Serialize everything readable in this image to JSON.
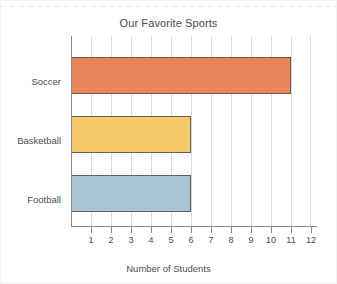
{
  "chart_data": {
    "type": "bar",
    "orientation": "horizontal",
    "title": "Our Favorite Sports",
    "xlabel": "Number of Students",
    "ylabel": "",
    "categories": [
      "Soccer",
      "Basketball",
      "Football"
    ],
    "values": [
      11,
      6,
      6
    ],
    "bars": [
      {
        "category": "Soccer",
        "value": 11,
        "color": "#E8855C",
        "border_color": "#6B5A4E"
      },
      {
        "category": "Basketball",
        "value": 6,
        "color": "#F4C969",
        "border_color": "#6B5A4E"
      },
      {
        "category": "Football",
        "value": 6,
        "color": "#A9C2D4",
        "border_color": "#6B5A4E"
      }
    ],
    "xlim": [
      0,
      12
    ],
    "xticks": [
      1,
      2,
      3,
      4,
      5,
      6,
      7,
      8,
      9,
      10,
      11,
      12
    ],
    "xtick_labels": [
      "1",
      "2",
      "3",
      "4",
      "5",
      "6",
      "7",
      "8",
      "9",
      "10",
      "11",
      "12"
    ],
    "grid": true,
    "grid_axis": "x",
    "legend": false,
    "legend_position": "none",
    "colors": {
      "background": "#FFFFFF",
      "gridline": "#D8D8D8",
      "axis": "#8A8A8A",
      "text": "#4C4C4C"
    }
  }
}
